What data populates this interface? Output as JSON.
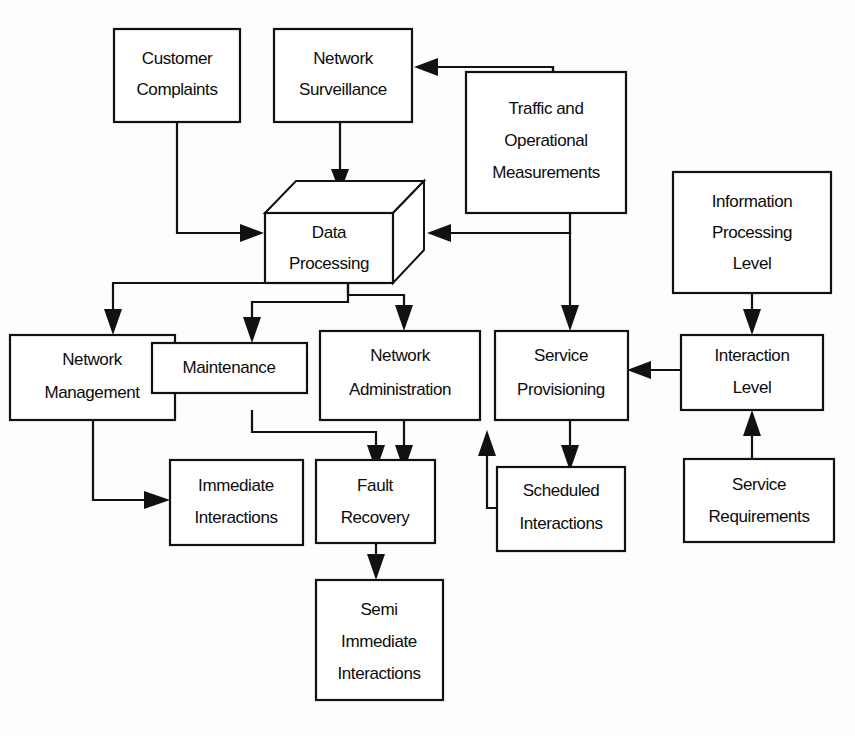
{
  "diagram": {
    "type": "block-flow-diagram",
    "background_color": "#fdfdfc",
    "line_color": "#111111",
    "box_fill_color": "#ffffff",
    "nodes": [
      {
        "id": "customer_complaints",
        "label_line1": "Customer",
        "label_line2": "Complaints",
        "label_line3": "",
        "shape": "rect"
      },
      {
        "id": "network_surveillance",
        "label_line1": "Network",
        "label_line2": "Surveillance",
        "label_line3": "",
        "shape": "rect"
      },
      {
        "id": "traffic_operational",
        "label_line1": "Traffic and",
        "label_line2": "Operational",
        "label_line3": "Measurements",
        "shape": "rect"
      },
      {
        "id": "data_processing",
        "label_line1": "Data",
        "label_line2": "Processing",
        "label_line3": "",
        "shape": "cube"
      },
      {
        "id": "information_processing",
        "label_line1": "Information",
        "label_line2": "Processing",
        "label_line3": "Level",
        "shape": "rect"
      },
      {
        "id": "network_management",
        "label_line1": "Network",
        "label_line2": "Management",
        "label_line3": "",
        "shape": "rect"
      },
      {
        "id": "maintenance",
        "label_line1": "Maintenance",
        "label_line2": "",
        "label_line3": "",
        "shape": "rect"
      },
      {
        "id": "network_administration",
        "label_line1": "Network",
        "label_line2": "Administration",
        "label_line3": "",
        "shape": "rect"
      },
      {
        "id": "service_provisioning",
        "label_line1": "Service",
        "label_line2": "Provisioning",
        "label_line3": "",
        "shape": "rect"
      },
      {
        "id": "interaction_level",
        "label_line1": "Interaction",
        "label_line2": "Level",
        "label_line3": "",
        "shape": "rect"
      },
      {
        "id": "immediate_interactions",
        "label_line1": "Immediate",
        "label_line2": "Interactions",
        "label_line3": "",
        "shape": "rect"
      },
      {
        "id": "fault_recovery",
        "label_line1": "Fault",
        "label_line2": "Recovery",
        "label_line3": "",
        "shape": "rect"
      },
      {
        "id": "scheduled_interactions",
        "label_line1": "Scheduled",
        "label_line2": "Interactions",
        "label_line3": "",
        "shape": "rect"
      },
      {
        "id": "service_requirements",
        "label_line1": "Service",
        "label_line2": "Requirements",
        "label_line3": "",
        "shape": "rect"
      },
      {
        "id": "semi_immediate",
        "label_line1": "Semi",
        "label_line2": "Immediate",
        "label_line3": "Interactions",
        "shape": "rect"
      }
    ],
    "edges": [
      {
        "from": "traffic_operational",
        "to": "network_surveillance",
        "style": "orthogonal",
        "arrow": "left"
      },
      {
        "from": "customer_complaints",
        "to": "data_processing",
        "style": "orthogonal",
        "arrow": "right"
      },
      {
        "from": "network_surveillance",
        "to": "data_processing",
        "style": "straight",
        "arrow": "down"
      },
      {
        "from": "traffic_operational",
        "to": "data_processing",
        "style": "orthogonal",
        "arrow": "left"
      },
      {
        "from": "data_processing",
        "to": "network_management",
        "style": "orthogonal",
        "arrow": "down"
      },
      {
        "from": "data_processing",
        "to": "maintenance",
        "style": "orthogonal",
        "arrow": "down"
      },
      {
        "from": "data_processing",
        "to": "network_administration",
        "style": "orthogonal",
        "arrow": "down"
      },
      {
        "from": "data_processing",
        "to": "service_provisioning",
        "style": "orthogonal",
        "arrow": "down"
      },
      {
        "from": "information_processing",
        "to": "interaction_level",
        "style": "straight",
        "arrow": "down"
      },
      {
        "from": "interaction_level",
        "to": "service_provisioning",
        "style": "straight",
        "arrow": "left"
      },
      {
        "from": "service_requirements",
        "to": "interaction_level",
        "style": "straight",
        "arrow": "up"
      },
      {
        "from": "network_management",
        "to": "immediate_interactions",
        "style": "orthogonal",
        "arrow": "right"
      },
      {
        "from": "maintenance",
        "to": "fault_recovery",
        "style": "orthogonal",
        "arrow": "down"
      },
      {
        "from": "network_administration",
        "to": "fault_recovery",
        "style": "straight",
        "arrow": "down"
      },
      {
        "from": "service_provisioning",
        "to": "scheduled_interactions",
        "style": "straight",
        "arrow": "down"
      },
      {
        "from": "scheduled_interactions",
        "to": "network_administration",
        "style": "orthogonal",
        "arrow": "up"
      },
      {
        "from": "fault_recovery",
        "to": "semi_immediate",
        "style": "straight",
        "arrow": "down"
      }
    ]
  }
}
